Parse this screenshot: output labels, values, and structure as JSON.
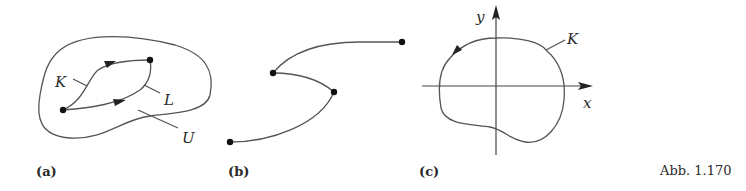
{
  "figure": {
    "caption": "Abb. 1.170",
    "panels": [
      {
        "id": "a",
        "label": "(a)",
        "curve_labels": {
          "K": "K",
          "L": "L",
          "U": "U"
        },
        "description": "Two oriented curves K and L from a start point to an end point inside region U"
      },
      {
        "id": "b",
        "label": "(b)",
        "description": "Piecewise smooth path with four marked points"
      },
      {
        "id": "c",
        "label": "(c)",
        "axis_labels": {
          "x": "x",
          "y": "y"
        },
        "curve_label": "K",
        "description": "Closed curve K around origin, counterclockwise orientation"
      }
    ]
  },
  "colors": {
    "line": "#555555",
    "dot": "#111111",
    "text": "#2a2a2a"
  }
}
